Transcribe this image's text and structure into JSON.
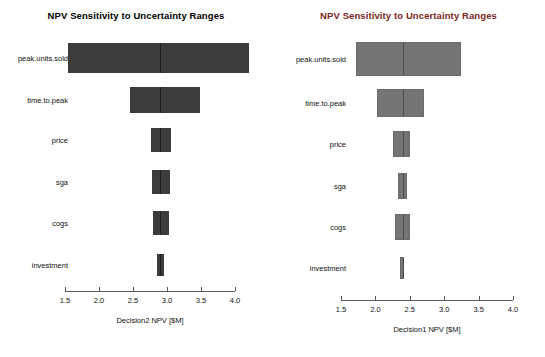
{
  "figure": {
    "width": 545,
    "height": 357,
    "background": "#ffffff",
    "panel_count": 2
  },
  "chart_data": [
    {
      "panel": "left",
      "type": "bar",
      "orientation": "horizontal",
      "style": "tornado",
      "title": "NPV Sensitivity to Uncertainty Ranges",
      "title_color": "#000000",
      "bar_color": "#3c3c3c",
      "xlabel": "Decision2 NPV [$M]",
      "ylabel": "",
      "xlim": [
        1.4,
        4.3
      ],
      "xticks": [
        1.5,
        2.0,
        2.5,
        3.0,
        3.5,
        4.0
      ],
      "xtick_labels": [
        "1.5",
        "2.0",
        "2.5",
        "3.0",
        "3.5",
        "4.0"
      ],
      "grid": false,
      "legend": "none",
      "base_value": 2.9,
      "categories": [
        "peak.units.sold",
        "time.to.peak",
        "price",
        "sga",
        "cogs",
        "investment"
      ],
      "bars": [
        {
          "category": "peak.units.sold",
          "low": 1.54,
          "high": 4.21,
          "mid": 2.9
        },
        {
          "category": "time.to.peak",
          "low": 2.46,
          "high": 3.49,
          "mid": 2.9
        },
        {
          "category": "price",
          "low": 2.76,
          "high": 3.06,
          "mid": 2.9
        },
        {
          "category": "sga",
          "low": 2.78,
          "high": 3.04,
          "mid": 2.9
        },
        {
          "category": "cogs",
          "low": 2.79,
          "high": 3.03,
          "mid": 2.9
        },
        {
          "category": "investment",
          "low": 2.86,
          "high": 2.95,
          "mid": 2.9
        }
      ]
    },
    {
      "panel": "right",
      "type": "bar",
      "orientation": "horizontal",
      "style": "tornado",
      "title": "NPV Sensitivity to Uncertainty Ranges",
      "title_color": "#7a2622",
      "bar_color": "#757575",
      "xlabel": "Decision1 NPV [$M]",
      "ylabel": "",
      "xlim": [
        1.4,
        4.2
      ],
      "xticks": [
        1.5,
        2.0,
        2.5,
        3.0,
        3.5,
        4.0
      ],
      "xtick_labels": [
        "1.5",
        "2.0",
        "2.5",
        "3.0",
        "3.5",
        "4.0"
      ],
      "grid": false,
      "legend": "none",
      "base_value": 2.39,
      "categories": [
        "peak.units.sold",
        "time.to.peak",
        "price",
        "sga",
        "cogs",
        "investment"
      ],
      "bars": [
        {
          "category": "peak.units.sold",
          "low": 1.72,
          "high": 3.25,
          "mid": 2.39
        },
        {
          "category": "time.to.peak",
          "low": 2.03,
          "high": 2.71,
          "mid": 2.39
        },
        {
          "category": "price",
          "low": 2.25,
          "high": 2.51,
          "mid": 2.39
        },
        {
          "category": "sga",
          "low": 2.33,
          "high": 2.46,
          "mid": 2.39
        },
        {
          "category": "cogs",
          "low": 2.28,
          "high": 2.5,
          "mid": 2.39
        },
        {
          "category": "investment",
          "low": 2.36,
          "high": 2.42,
          "mid": 2.39
        }
      ]
    }
  ]
}
